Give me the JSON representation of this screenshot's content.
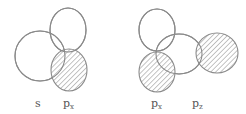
{
  "diagram": {
    "colors": {
      "stroke": "#8a8a8a",
      "hatch": "#8a8a8a",
      "background": "#ffffff"
    },
    "left": {
      "shapes": [
        {
          "name": "s-orbital",
          "cx": 40,
          "cy": 56,
          "rx": 25,
          "ry": 25,
          "shaded": false
        },
        {
          "name": "px-lobe-top",
          "cx": 68,
          "cy": 30,
          "rx": 18,
          "ry": 22,
          "shaded": false
        },
        {
          "name": "px-lobe-bottom",
          "cx": 69,
          "cy": 70,
          "rx": 18,
          "ry": 21,
          "shaded": true
        }
      ],
      "labels": [
        {
          "name": "s",
          "base": "s",
          "sub": "",
          "x": 35,
          "y": 98
        },
        {
          "name": "px",
          "base": "p",
          "sub": "x",
          "x": 63,
          "y": 98
        }
      ]
    },
    "right": {
      "shapes": [
        {
          "name": "px-lobe-top",
          "cx": 157,
          "cy": 30,
          "rx": 18,
          "ry": 21,
          "shaded": false
        },
        {
          "name": "px-lobe-bottom",
          "cx": 157,
          "cy": 72,
          "rx": 18,
          "ry": 20,
          "shaded": true
        },
        {
          "name": "pz-lobe-left",
          "cx": 179,
          "cy": 54,
          "rx": 23,
          "ry": 20,
          "shaded": false
        },
        {
          "name": "pz-lobe-right",
          "cx": 217,
          "cy": 53,
          "rx": 21,
          "ry": 20,
          "shaded": true
        }
      ],
      "labels": [
        {
          "name": "px",
          "base": "p",
          "sub": "x",
          "x": 151,
          "y": 98
        },
        {
          "name": "pz",
          "base": "p",
          "sub": "z",
          "x": 192,
          "y": 98
        }
      ]
    }
  }
}
